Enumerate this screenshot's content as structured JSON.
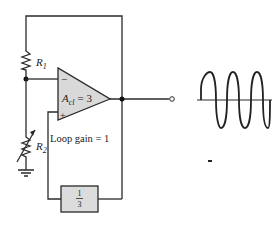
{
  "diagram": {
    "type": "oscillator-circuit",
    "amplifier": {
      "gain_label": "A",
      "gain_subscript": "cl",
      "gain_value": "= 3",
      "inverting_input": "−",
      "noninverting_input": "+"
    },
    "resistors": {
      "r1": {
        "label": "R",
        "subscript": "1"
      },
      "r2": {
        "label": "R",
        "subscript": "2",
        "variable": true
      }
    },
    "feedback_block": {
      "numerator": "1",
      "denominator": "3"
    },
    "loop_gain_label": "Loop gain  =  1",
    "output": {
      "waveform": "sine",
      "cycles": 3
    },
    "colors": {
      "line": "#2a2a2a",
      "fill": "#d9d9d9",
      "background": "#ffffff"
    }
  }
}
